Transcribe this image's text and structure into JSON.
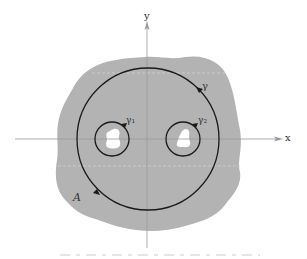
{
  "figure": {
    "axes": {
      "x_label": "x",
      "y_label": "y"
    },
    "region": {
      "label": "A",
      "fill": "#b3b3b3"
    },
    "contours": [
      {
        "id": "gamma",
        "label": "γ",
        "center": [
          148,
          139
        ],
        "radius": 71
      },
      {
        "id": "gamma1",
        "label": "γ₁",
        "center": [
          112,
          139
        ],
        "radius": 17
      },
      {
        "id": "gamma2",
        "label": "γ₂",
        "center": [
          183,
          139
        ],
        "radius": 17
      }
    ],
    "colors": {
      "axis": "#9a9a9a",
      "contour": "#1a1a1a",
      "hole": "#ffffff",
      "background": "#ffffff"
    }
  }
}
